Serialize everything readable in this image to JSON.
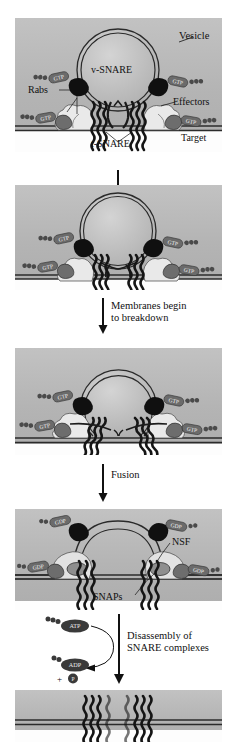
{
  "figure": {
    "colors": {
      "panel_background": "#b9b9b9",
      "white_strip": "#fdfdfd",
      "membrane_line": "#2b2b2b",
      "snare_helix": "#151515",
      "rab_dark": "#101010",
      "rab_gray": "#6d6d6d",
      "effector_pale": "#e8e8e8",
      "nucleotide_tag": "#5a5a5a",
      "text": "#111111"
    }
  },
  "panels": [
    {
      "id": "panel-docking",
      "labels": {
        "vesicle": "Vesicle",
        "v_snare": "v-SNARE",
        "rabs": "Rabs",
        "effectors": "Effectors",
        "t_snare": "t-SNARE",
        "target": "Target"
      },
      "nucleotides": [
        "GTP",
        "GTP",
        "GTP",
        "GTP"
      ]
    },
    {
      "id": "panel-tethered",
      "labels": {},
      "nucleotides": [
        "GTP",
        "GTP",
        "GTP",
        "GTP"
      ]
    },
    {
      "id": "panel-hemifusion",
      "labels": {},
      "nucleotides": [
        "GTP",
        "GTP",
        "GTP",
        "GTP"
      ]
    },
    {
      "id": "panel-fused",
      "labels": {
        "nsf": "NSF",
        "snaps": "SNAPs"
      },
      "nucleotides": [
        "GDP",
        "GDP",
        "GDP",
        "GDP"
      ]
    },
    {
      "id": "panel-disassembled",
      "labels": {},
      "nucleotides": []
    }
  ],
  "transitions": [
    {
      "id": "transition-1",
      "label": ""
    },
    {
      "id": "transition-2",
      "label": "Membranes begin\nto breakdown"
    },
    {
      "id": "transition-3",
      "label": "Fusion"
    },
    {
      "id": "transition-4",
      "label": "Disassembly of\nSNARE complexes"
    }
  ],
  "energetics": {
    "atp_label": "ATP",
    "adp_label": "ADP",
    "phosphate_label": "+",
    "phosphate_symbol": "P"
  }
}
